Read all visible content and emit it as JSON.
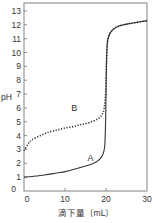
{
  "chart_data": {
    "type": "line",
    "title": "",
    "xlabel": "滴下量〔mL〕",
    "ylabel": "pH",
    "xlim": [
      0,
      30
    ],
    "ylim": [
      0,
      13.7
    ],
    "x_ticks": [
      0,
      10,
      20,
      30
    ],
    "y_ticks": [
      0,
      1,
      2,
      3,
      4,
      5,
      6,
      7,
      8,
      9,
      10,
      11,
      12,
      13
    ],
    "grid": false,
    "legend": "inline labels",
    "series": [
      {
        "name": "A",
        "style": "solid",
        "x": [
          0,
          2,
          5,
          8,
          10,
          12,
          15,
          17,
          18.5,
          19.3,
          19.7,
          19.9,
          20.0,
          20.1,
          20.3,
          20.7,
          21.5,
          23,
          25,
          27,
          30
        ],
        "y": [
          1.0,
          1.05,
          1.15,
          1.3,
          1.4,
          1.55,
          1.8,
          2.0,
          2.3,
          2.7,
          3.3,
          5.0,
          7.0,
          9.0,
          10.6,
          11.2,
          11.6,
          11.9,
          12.05,
          12.15,
          12.3
        ]
      },
      {
        "name": "B",
        "style": "dotted",
        "x": [
          0,
          1,
          2,
          4,
          6,
          8,
          10,
          12,
          14,
          16,
          18,
          19,
          19.5,
          19.8,
          20.0,
          20.1,
          20.3,
          20.7,
          21.5,
          23,
          25,
          27,
          30
        ],
        "y": [
          2.9,
          3.4,
          3.7,
          4.0,
          4.25,
          4.4,
          4.55,
          4.65,
          4.8,
          4.95,
          5.2,
          5.5,
          5.9,
          6.6,
          7.6,
          9.0,
          10.6,
          11.2,
          11.6,
          11.9,
          12.05,
          12.15,
          12.3
        ]
      }
    ],
    "annotations": [
      {
        "text": "A",
        "x": 15.5,
        "y": 2.2
      },
      {
        "text": "B",
        "x": 11.5,
        "y": 5.8
      }
    ]
  },
  "labels": {
    "ylabel": "pH",
    "xlabel": "滴下量〔mL〕",
    "curve_a": "A",
    "curve_b": "B"
  }
}
